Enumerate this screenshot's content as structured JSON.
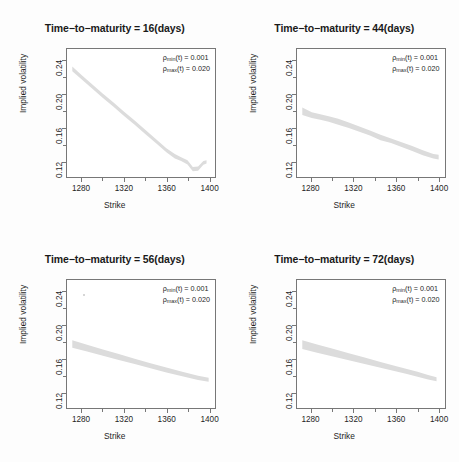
{
  "figure": {
    "width": 459,
    "height": 462,
    "background": "#fdfdfd",
    "band_color": "#dcdcdc",
    "axis_color": "#777777",
    "text_color": "#1f1f1f"
  },
  "axis": {
    "xtitle": "Strike",
    "ytitle": "Implied volatility",
    "xticks": [
      "1280",
      "1320",
      "1360",
      "1400"
    ],
    "xtick_values": [
      1280,
      1320,
      1360,
      1400
    ],
    "xminor_values": [
      1300,
      1340,
      1380
    ],
    "yticks": [
      "0.12",
      "0.16",
      "0.20",
      "0.24"
    ],
    "ytick_values": [
      0.12,
      0.16,
      0.2,
      0.24
    ],
    "yminor_values": [
      0.14,
      0.18,
      0.22
    ],
    "xlim": [
      1266,
      1406
    ],
    "ylim": [
      0.1015,
      0.2545
    ]
  },
  "annotation": {
    "rho_min_label": "ρ",
    "rho_min_sub": "min",
    "rho_min_rest": "(t) = 0.001",
    "rho_max_label": "ρ",
    "rho_max_sub": "max",
    "rho_max_rest": "(t) = 0.020",
    "rho_min_value": "0.001",
    "rho_max_value": "0.020"
  },
  "panels": [
    {
      "id": "panel-16",
      "title": "Time−to−maturity = 16(days)",
      "maturity_days": 16,
      "speck": null
    },
    {
      "id": "panel-44",
      "title": "Time−to−maturity = 44(days)",
      "maturity_days": 44,
      "speck": null
    },
    {
      "id": "panel-56",
      "title": "Time−to−maturity = 56(days)",
      "maturity_days": 56,
      "speck": {
        "x": 1281,
        "y": 0.2385
      }
    },
    {
      "id": "panel-72",
      "title": "Time−to−maturity = 72(days)",
      "maturity_days": 72,
      "speck": null
    }
  ],
  "chart_data": {
    "type": "area",
    "xlabel": "Strike",
    "ylabel": "Implied volatility",
    "xlim": [
      1266,
      1406
    ],
    "ylim": [
      0.1015,
      0.2545
    ],
    "grid": false,
    "legend": "none",
    "panels": [
      {
        "name": "Time-to-maturity = 16(days)",
        "maturity_days": 16,
        "x": [
          1271,
          1280,
          1290,
          1300,
          1310,
          1320,
          1330,
          1340,
          1350,
          1360,
          1368,
          1374,
          1380,
          1385,
          1390,
          1395,
          1398
        ],
        "lower": [
          0.228,
          0.218,
          0.207,
          0.196,
          0.1855,
          0.1745,
          0.164,
          0.153,
          0.142,
          0.131,
          0.1235,
          0.1205,
          0.1165,
          0.1085,
          0.109,
          0.116,
          0.1175
        ],
        "upper": [
          0.2335,
          0.223,
          0.212,
          0.201,
          0.1905,
          0.1795,
          0.169,
          0.158,
          0.147,
          0.136,
          0.129,
          0.125,
          0.1215,
          0.1135,
          0.114,
          0.1205,
          0.1215
        ]
      },
      {
        "name": "Time-to-maturity = 44(days)",
        "maturity_days": 44,
        "x": [
          1271,
          1280,
          1288,
          1296,
          1305,
          1315,
          1325,
          1335,
          1345,
          1355,
          1365,
          1375,
          1385,
          1395,
          1400
        ],
        "lower": [
          0.1755,
          0.172,
          0.17,
          0.1675,
          0.164,
          0.16,
          0.1555,
          0.151,
          0.1455,
          0.142,
          0.1375,
          0.1325,
          0.1275,
          0.1235,
          0.1225
        ],
        "upper": [
          0.1845,
          0.179,
          0.1765,
          0.174,
          0.171,
          0.1665,
          0.162,
          0.157,
          0.152,
          0.1475,
          0.143,
          0.1385,
          0.1335,
          0.129,
          0.128
        ]
      },
      {
        "name": "Time-to-maturity = 56(days)",
        "maturity_days": 56,
        "x": [
          1271,
          1285,
          1300,
          1315,
          1330,
          1345,
          1360,
          1375,
          1390,
          1400
        ],
        "lower": [
          0.1735,
          0.169,
          0.164,
          0.159,
          0.154,
          0.149,
          0.144,
          0.1395,
          0.135,
          0.133
        ],
        "upper": [
          0.1825,
          0.177,
          0.1715,
          0.166,
          0.1605,
          0.155,
          0.1498,
          0.1448,
          0.14,
          0.1378
        ]
      },
      {
        "name": "Time-to-maturity = 72(days)",
        "maturity_days": 72,
        "x": [
          1271,
          1285,
          1300,
          1315,
          1330,
          1345,
          1360,
          1370,
          1380,
          1390,
          1398
        ],
        "lower": [
          0.172,
          0.1675,
          0.163,
          0.1585,
          0.154,
          0.1495,
          0.145,
          0.142,
          0.139,
          0.1355,
          0.1335
        ],
        "upper": [
          0.1825,
          0.1775,
          0.1722,
          0.167,
          0.1618,
          0.1565,
          0.1515,
          0.1482,
          0.1448,
          0.141,
          0.1382
        ]
      }
    ]
  }
}
